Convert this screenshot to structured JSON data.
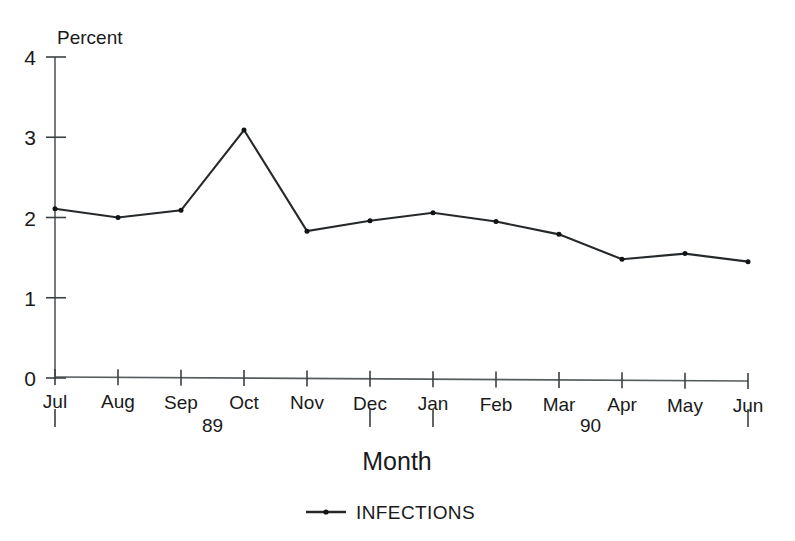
{
  "chart_data": {
    "type": "line",
    "title": "",
    "ylabel": "Percent",
    "xlabel": "Month",
    "ylim": [
      0,
      4
    ],
    "y_ticks": [
      "0",
      "1",
      "2",
      "3",
      "4"
    ],
    "grid": false,
    "legend_position": "bottom-center",
    "categories": [
      "Jul",
      "Aug",
      "Sep",
      "Oct",
      "Nov",
      "Dec",
      "Jan",
      "Feb",
      "Mar",
      "Apr",
      "May",
      "Jun"
    ],
    "group_labels": [
      {
        "label": "89",
        "start_category": "Jul",
        "end_category": "Dec"
      },
      {
        "label": "90",
        "start_category": "Jan",
        "end_category": "Jun"
      }
    ],
    "series": [
      {
        "name": "INFECTIONS",
        "marker": "dot",
        "color": "#26292b",
        "values": [
          2.11,
          2.0,
          2.09,
          3.09,
          1.83,
          1.96,
          2.06,
          1.95,
          1.79,
          1.48,
          1.55,
          1.45
        ]
      }
    ]
  },
  "legend": {
    "entries": [
      {
        "label": "INFECTIONS"
      }
    ]
  },
  "footer": {
    "credit": ""
  }
}
